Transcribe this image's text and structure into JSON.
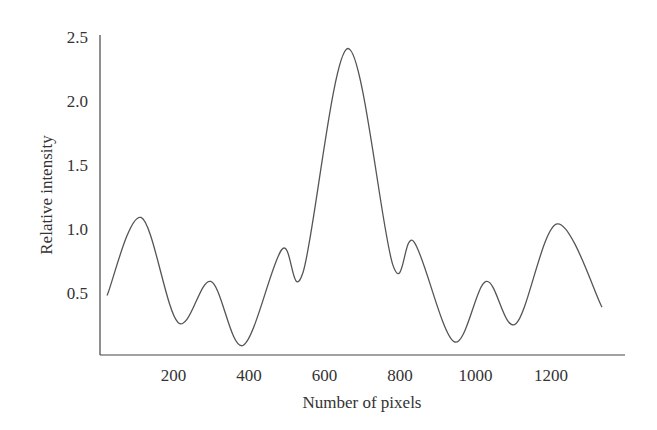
{
  "chart_data": {
    "type": "line",
    "title": "",
    "xlabel": "Number of pixels",
    "ylabel": "Relative intensity",
    "xlim": [
      0,
      1400
    ],
    "ylim": [
      0,
      2.5
    ],
    "xticks": [
      200,
      400,
      600,
      800,
      1000,
      1200
    ],
    "xtick_labels": [
      "200",
      "400",
      "600",
      "800",
      "1000",
      "1200"
    ],
    "yticks": [
      0.5,
      1.0,
      1.5,
      2.0,
      2.5
    ],
    "ytick_labels": [
      "0.5",
      "1.0",
      "1.5",
      "2.0",
      "2.5"
    ],
    "grid": false,
    "legend": null,
    "series": [
      {
        "name": "intensity profile",
        "color": "#555555",
        "x": [
          24,
          114,
          212,
          299,
          384,
          487,
          543,
          662,
          781,
          837,
          943,
          1028,
          1107,
          1216,
          1335
        ],
        "y": [
          0.48,
          1.09,
          0.27,
          0.59,
          0.09,
          0.84,
          0.66,
          2.41,
          0.72,
          0.9,
          0.12,
          0.59,
          0.26,
          1.04,
          0.39
        ]
      }
    ]
  }
}
